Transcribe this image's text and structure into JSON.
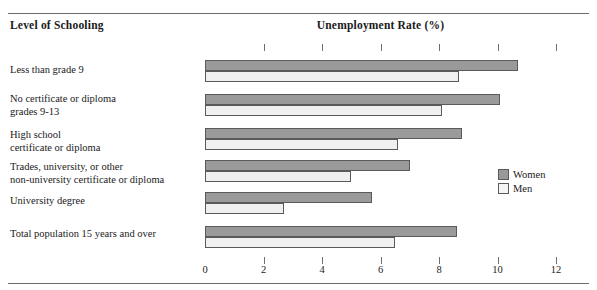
{
  "header": {
    "left_title": "Level of Schooling",
    "center_title": "Unemployment Rate (%)"
  },
  "legend": {
    "position": "right",
    "items": [
      {
        "label": "Women",
        "color": "#9a9a9a"
      },
      {
        "label": "Men",
        "color": "#f4f5f4"
      }
    ]
  },
  "axis": {
    "ticks": [
      "0",
      "2",
      "4",
      "6",
      "8",
      "10",
      "12"
    ]
  },
  "chart_data": {
    "type": "bar",
    "orientation": "horizontal",
    "title": "Unemployment Rate (%)",
    "xlabel": "Unemployment Rate (%)",
    "ylabel": "Level of Schooling",
    "xlim": [
      0,
      12
    ],
    "xticks": [
      0,
      2,
      4,
      6,
      8,
      10,
      12
    ],
    "grid": false,
    "legend_position": "right",
    "categories": [
      "Less than grade 9",
      "No certificate or diploma\ngrades 9-13",
      "High school\ncertificate or diploma",
      "Trades, university, or other\nnon-university certificate or diploma",
      "University degree",
      "Total population 15 years and over"
    ],
    "series": [
      {
        "name": "Women",
        "color": "#9a9a9a",
        "values": [
          10.7,
          10.1,
          8.8,
          7.0,
          5.7,
          8.6
        ]
      },
      {
        "name": "Men",
        "color": "#f4f5f4",
        "values": [
          8.7,
          8.1,
          6.6,
          5.0,
          2.7,
          6.5
        ]
      }
    ]
  }
}
